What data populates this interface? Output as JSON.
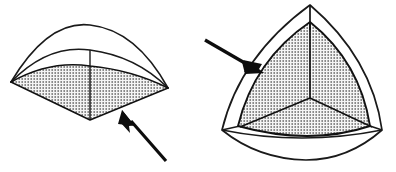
{
  "document": {
    "title": "Spherical triangle solid — two orientations",
    "background_color": "#ffffff",
    "width": 396,
    "height": 172,
    "style": "black-and-white technical line drawing, stippled shading"
  },
  "palette": {
    "ink": "#111111",
    "stroke": "#1a1a1a",
    "paper": "#ffffff",
    "stipple_dot": "#2b2b2b",
    "stipple_background": "#f2f2f2",
    "arrow_fill": "#0d0d0d"
  },
  "figures": [
    {
      "id": "left-figure",
      "name": "flattened-spherical-triangle-edge-view",
      "label": "",
      "description": "Low, wide lens-shaped solid seen nearly edge-on, with an outer transparent envelope arc above a stippled inner spherical-triangle face.",
      "outer_shell": {
        "name": "outer-envelope-arc",
        "left_vertex": [
          11,
          82
        ],
        "right_vertex": [
          168,
          88
        ],
        "apex": [
          90,
          26
        ],
        "stroke_width": 1.5
      },
      "inner_shell": {
        "name": "inner-arc",
        "left_vertex": [
          11,
          82
        ],
        "right_vertex": [
          168,
          88
        ],
        "apex": [
          90,
          52
        ],
        "stroke_width": 1.5
      },
      "shaded_face": {
        "name": "stippled-inner-face",
        "left_vertex": [
          11,
          82
        ],
        "right_vertex": [
          168,
          88
        ],
        "top_apex": [
          90,
          66
        ],
        "bottom_apex": [
          90,
          120
        ],
        "fill": "stipple"
      },
      "center_tick": {
        "name": "vertical-center-tick",
        "from": [
          90,
          52
        ],
        "to": [
          90,
          66
        ]
      },
      "arrow": {
        "name": "pointer-arrow-left-figure",
        "tail": [
          165,
          160
        ],
        "head": [
          123,
          112
        ],
        "direction": "up-left",
        "points_at": "stippled-inner-face"
      }
    },
    {
      "id": "right-figure",
      "name": "spherical-triangle-face-on-view",
      "label": "",
      "description": "Rounded triangular (Reuleaux-like) solid seen face-on, outer transparent envelope enclosing a stippled inner spherical triangle divided into three lobes by a Y-shaped seam.",
      "outer_shell": {
        "name": "outer-envelope-outline",
        "apex": [
          310,
          5
        ],
        "left_vertex": [
          222,
          130
        ],
        "right_vertex": [
          382,
          130
        ],
        "bottom_apex": [
          306,
          160
        ],
        "stroke_width": 1.5
      },
      "inner_shell": {
        "name": "inner-stippled-triangle",
        "apex": [
          310,
          22
        ],
        "left_vertex": [
          238,
          126
        ],
        "right_vertex": [
          370,
          126
        ],
        "fill": "stipple"
      },
      "seam": {
        "name": "y-seam-division",
        "center": [
          310,
          98
        ],
        "arms": [
          {
            "name": "seam-arm-top",
            "to": [
              310,
              5
            ]
          },
          {
            "name": "seam-arm-lower-left",
            "to": [
              238,
              126
            ]
          },
          {
            "name": "seam-arm-lower-right",
            "to": [
              374,
              128
            ]
          }
        ]
      },
      "center_tick": {
        "name": "vertical-apex-tick",
        "from": [
          310,
          5
        ],
        "to": [
          310,
          30
        ]
      },
      "arrow": {
        "name": "pointer-arrow-right-figure",
        "tail": [
          206,
          40
        ],
        "head": [
          262,
          71
        ],
        "direction": "down-right",
        "points_at": "outer-envelope-outline"
      }
    }
  ]
}
